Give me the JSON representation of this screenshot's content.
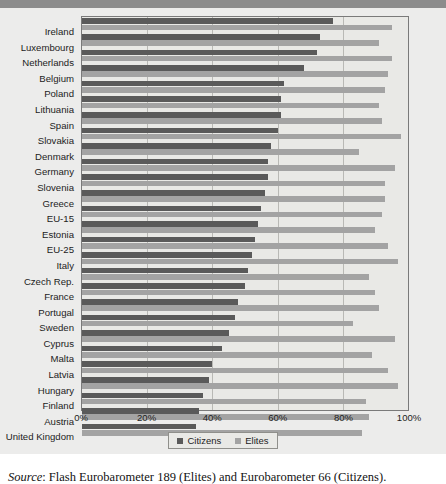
{
  "title_band": {
    "text": ""
  },
  "source_note": {
    "label": "Source",
    "separator": ": ",
    "text": "Flash Eurobarometer 189 (Elites) and Eurobarometer 66 (Citizens)."
  },
  "legend": {
    "position": "bottom-center",
    "entries": [
      {
        "name": "Citizens",
        "color": "#5a5a5a"
      },
      {
        "name": "Elites",
        "color": "#a3a3a3"
      }
    ]
  },
  "colors": {
    "citizens": "#5a5a5a",
    "elites": "#a3a3a3",
    "plot_background": "#e9e9e6",
    "figure_background": "#ececeb",
    "gridline": "#b9b9b5",
    "plot_border": "#7a7a7a"
  },
  "chart_data": {
    "type": "bar",
    "orientation": "horizontal",
    "title": "",
    "xlabel": "",
    "ylabel": "",
    "xlim": [
      0,
      100
    ],
    "xticks": [
      "0%",
      "20%",
      "40%",
      "60%",
      "80%",
      "100%"
    ],
    "xtick_values": [
      0,
      20,
      40,
      60,
      80,
      100
    ],
    "grid": true,
    "legend": [
      "Citizens",
      "Elites"
    ],
    "categories": [
      "Ireland",
      "Luxembourg",
      "Netherlands",
      "Belgium",
      "Poland",
      "Lithuania",
      "Spain",
      "Slovakia",
      "Denmark",
      "Germany",
      "Slovenia",
      "Greece",
      "EU-15",
      "Estonia",
      "EU-25",
      "Italy",
      "Czech Rep.",
      "France",
      "Portugal",
      "Sweden",
      "Cyprus",
      "Malta",
      "Latvia",
      "Hungary",
      "Finland",
      "Austria",
      "United Kingdom"
    ],
    "series": [
      {
        "name": "Citizens",
        "color": "#5a5a5a",
        "values": [
          77,
          73,
          72,
          68,
          62,
          61,
          61,
          60,
          58,
          57,
          57,
          56,
          55,
          54,
          53,
          52,
          51,
          50,
          48,
          47,
          45,
          43,
          40,
          39,
          37,
          36,
          35
        ]
      },
      {
        "name": "Elites",
        "color": "#a3a3a3",
        "values": [
          95,
          91,
          95,
          94,
          93,
          91,
          92,
          98,
          85,
          96,
          93,
          93,
          92,
          90,
          94,
          97,
          88,
          90,
          91,
          83,
          96,
          89,
          94,
          97,
          87,
          88,
          86
        ]
      }
    ]
  }
}
